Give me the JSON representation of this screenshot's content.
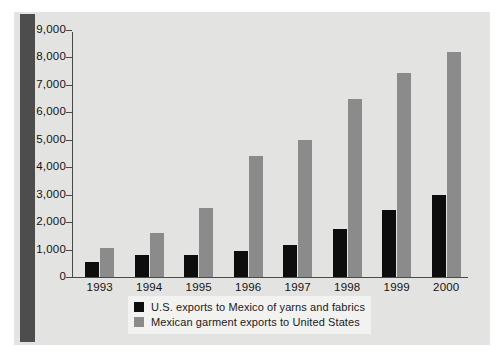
{
  "chart_data": {
    "type": "bar",
    "title": "",
    "subtitle": "",
    "xlabel": "",
    "ylabel": "",
    "categories": [
      "1993",
      "1994",
      "1995",
      "1996",
      "1997",
      "1998",
      "1999",
      "2000"
    ],
    "series": [
      {
        "name": "U.S. exports to Mexico of yarns and fabrics",
        "color": "#0d0d0d",
        "values": [
          550,
          800,
          820,
          950,
          1150,
          1750,
          2450,
          3000
        ]
      },
      {
        "name": "Mexican garment exports to United States",
        "color": "#8b8b8b",
        "values": [
          1070,
          1620,
          2520,
          4400,
          5000,
          6500,
          7450,
          8200
        ]
      }
    ],
    "ylim": [
      0,
      9000
    ],
    "ytick_labels": [
      "9,000",
      "8,000",
      "7,000",
      "6,000",
      "5,000",
      "4,000",
      "3,000",
      "2,000",
      "1,000",
      "0"
    ],
    "ytick_values": [
      9000,
      8000,
      7000,
      6000,
      5000,
      4000,
      3000,
      2000,
      1000,
      0
    ],
    "grid": false,
    "legend_position": "bottom-center",
    "legend_entries": [
      "U.S. exports to Mexico of yarns and fabrics",
      "Mexican garment exports to United States"
    ]
  },
  "colors": {
    "series_us": "#0d0d0d",
    "series_mx": "#8b8b8b",
    "panel_background": "#e3e3e1",
    "spine": "#4d4d4d",
    "axis": "#4a4a4a",
    "legend_background": "#f2f2f0"
  }
}
